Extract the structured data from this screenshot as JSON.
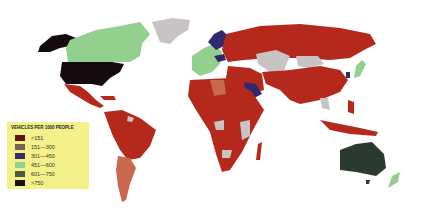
{
  "map": {
    "title": "Vehicles per 1000 people (world)",
    "colors": {
      "lt151": "#b5281c",
      "151_300": "#c9684c",
      "301_450": "#2f2a6e",
      "451_600": "#93cf8d",
      "601_750": "#2b3a2e",
      "gt750": "#150a0e",
      "no_data": "#c9c4c4"
    }
  },
  "legend": {
    "title": "VEHICLES PER 1000 PEOPLE",
    "items": [
      {
        "label": "<151",
        "color": "#5a1418"
      },
      {
        "label": "151—300",
        "color": "#7a6450"
      },
      {
        "label": "301—450",
        "color": "#3a2d62"
      },
      {
        "label": "451—600",
        "color": "#93cf8d"
      },
      {
        "label": "601—750",
        "color": "#4a5a3a"
      },
      {
        "label": ">750",
        "color": "#1a0e10"
      }
    ]
  }
}
